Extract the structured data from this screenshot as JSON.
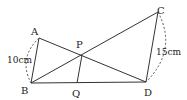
{
  "diagram": {
    "points": {
      "A": {
        "label": "A",
        "x": 39,
        "y": 38,
        "lx": 31,
        "ly": 34
      },
      "B": {
        "label": "B",
        "x": 31,
        "y": 83,
        "lx": 22,
        "ly": 94
      },
      "C": {
        "label": "C",
        "x": 158,
        "y": 12,
        "lx": 157,
        "ly": 13
      },
      "D": {
        "label": "D",
        "x": 146,
        "y": 82,
        "lx": 144,
        "ly": 94
      },
      "P": {
        "label": "P",
        "x": 82,
        "y": 55,
        "lx": 77,
        "ly": 47
      },
      "Q": {
        "label": "Q",
        "x": 77,
        "y": 83,
        "lx": 72,
        "ly": 95
      }
    },
    "segments": [
      [
        "A",
        "B"
      ],
      [
        "A",
        "D"
      ],
      [
        "B",
        "C"
      ],
      [
        "C",
        "D"
      ],
      [
        "B",
        "D"
      ],
      [
        "P",
        "Q"
      ]
    ],
    "measurements": {
      "AB": {
        "text": "10cm",
        "x": 8,
        "y": 63
      },
      "CD": {
        "text": "15cm",
        "x": 155,
        "y": 54
      }
    },
    "colors": {
      "line": "#333333",
      "text": "#222222",
      "background": "#ffffff"
    }
  }
}
